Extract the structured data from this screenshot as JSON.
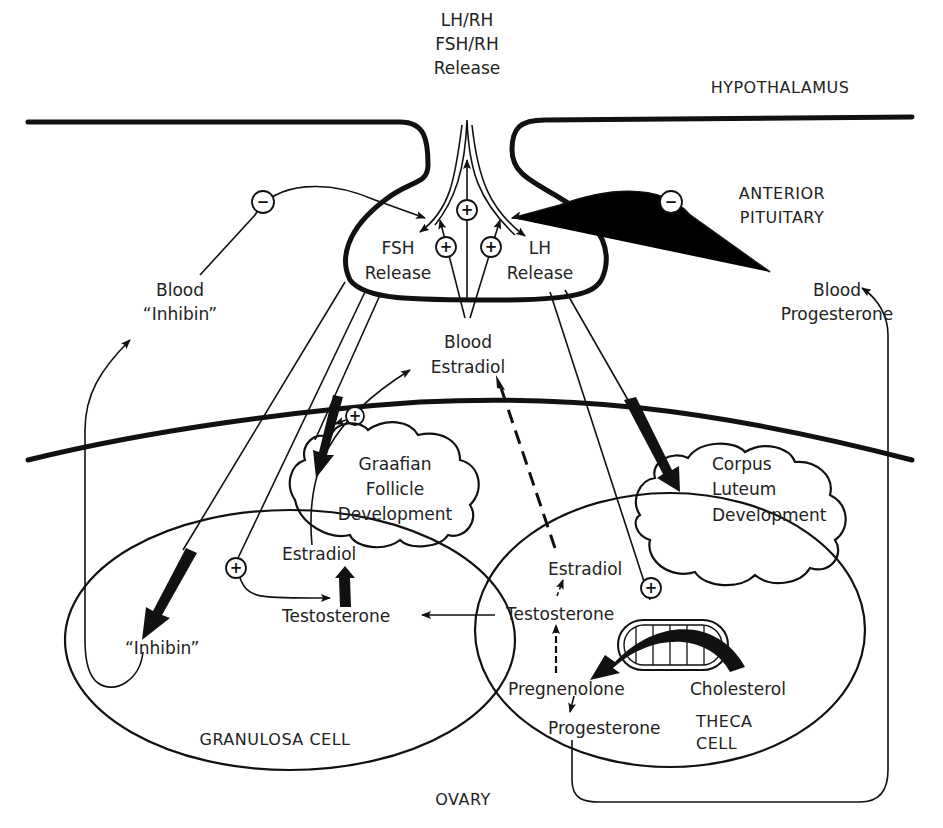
{
  "diagram": {
    "type": "hormonal feedback diagram",
    "regions": {
      "hypothalamus": "HYPOTHALAMUS",
      "anterior_pituitary_line1": "ANTERIOR",
      "anterior_pituitary_line2": "PITUITARY",
      "ovary": "OVARY",
      "granulosa_cell": "GRANULOSA CELL",
      "theca_cell_line1": "THECA",
      "theca_cell_line2": "CELL"
    },
    "top_release": {
      "line1": "LH/RH",
      "line2": "FSH/RH",
      "line3": "Release"
    },
    "pituitary": {
      "fsh_line1": "FSH",
      "fsh_line2": "Release",
      "lh_line1": "LH",
      "lh_line2": "Release"
    },
    "blood": {
      "inhibin_line1": "Blood",
      "inhibin_line2": "“Inhibin”",
      "estradiol_line1": "Blood",
      "estradiol_line2": "Estradiol",
      "progesterone_line1": "Blood",
      "progesterone_line2": "Progesterone"
    },
    "development": {
      "graafian_line1": "Graafian",
      "graafian_line2": "Follicle",
      "graafian_line3": "Development",
      "corpus_line1": "Corpus",
      "corpus_line2": "Luteum",
      "corpus_line3": "Development"
    },
    "granulosa": {
      "estradiol": "Estradiol",
      "testosterone": "Testosterone",
      "inhibin": "“Inhibin”"
    },
    "theca": {
      "estradiol": "Estradiol",
      "testosterone": "Testosterone",
      "pregnenolone": "Pregnenolone",
      "cholesterol": "Cholesterol",
      "progesterone": "Progesterone"
    },
    "signs": {
      "plus": "+",
      "minus": "−"
    }
  }
}
